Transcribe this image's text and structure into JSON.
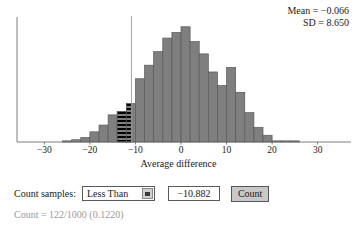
{
  "stats": {
    "mean_line": "Mean = −0.066",
    "sd_line": "SD = 8.650"
  },
  "controls": {
    "label": "Count samples:",
    "direction_select": {
      "value": "Less Than",
      "options": [
        "Less Than",
        "Greater Than",
        "Between",
        "Beyond"
      ]
    },
    "threshold_input": {
      "value": "−10.882",
      "placeholder": ""
    },
    "count_button": "Count"
  },
  "result": {
    "text": "Count = 122/1000 (0.1220)",
    "color": "#9a9a9a"
  },
  "chart_data": {
    "type": "bar",
    "title": "",
    "xlabel": "Average difference",
    "ylabel": "",
    "xlim": [
      -36,
      36
    ],
    "ylim": [
      0,
      108
    ],
    "xticks": [
      -30,
      -20,
      -10,
      0,
      10,
      20,
      30
    ],
    "xtick_labels": [
      "−30",
      "−20",
      "−10",
      "0",
      "10",
      "20",
      "30"
    ],
    "grid": false,
    "legend": null,
    "bin_width": 2,
    "bar_fill": "#7f7f7f",
    "bar_stroke": "#5a5a5a",
    "axis_color": "#6e6e6e",
    "reference_line": {
      "x": -10.882,
      "color": "#9a9a9a",
      "label": "threshold"
    },
    "highlight": {
      "mode": "less-than",
      "style": "black-horizontal-stripes",
      "x_max": -10.882,
      "count": 122,
      "total": 1000,
      "proportion": 0.122
    },
    "bin_centers": [
      -25,
      -23,
      -21,
      -19,
      -17,
      -15,
      -13,
      -11,
      -9,
      -7,
      -5,
      -3,
      -1,
      1,
      3,
      5,
      7,
      9,
      11,
      13,
      15,
      17,
      19,
      21,
      23,
      25
    ],
    "values": [
      1,
      2,
      4,
      9,
      15,
      24,
      27,
      34,
      56,
      68,
      80,
      92,
      97,
      102,
      89,
      78,
      62,
      50,
      66,
      44,
      26,
      13,
      6,
      1,
      1,
      1
    ]
  }
}
